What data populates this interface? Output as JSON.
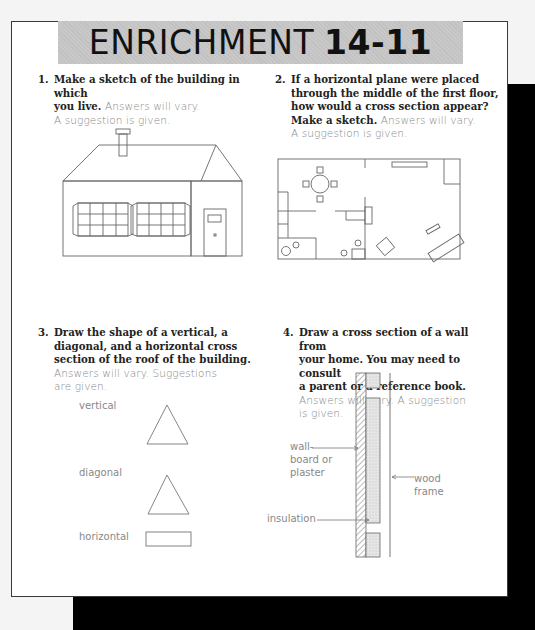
{
  "header": {
    "title_word": "ENRICHMENT",
    "title_number": "14-11"
  },
  "questions": [
    {
      "number": "1.",
      "prompt": "Make a sketch of the building in which you live.",
      "answer": "Answers will vary. A suggestion is given.",
      "figure": "house-sketch"
    },
    {
      "number": "2.",
      "prompt": "If a horizontal plane were placed through the middle of the first floor, how would a cross section appear? Make a sketch.",
      "answer": "Answers will vary. A suggestion is given.",
      "figure": "floor-plan-cross-section"
    },
    {
      "number": "3.",
      "prompt": "Draw the shape of a vertical, a diagonal, and a horizontal cross section of the roof of the building.",
      "answer": "Answers will vary. Suggestions are given.",
      "figure": "roof-cross-sections",
      "labels": [
        "vertical",
        "diagonal",
        "horizontal"
      ]
    },
    {
      "number": "4.",
      "prompt": "Draw a cross section of a wall from your home. You may need to consult a parent or a reference book.",
      "answer": "Answers will vary. A suggestion is given.",
      "figure": "wall-cross-section",
      "labels": [
        "wall-board or plaster",
        "wood frame",
        "insulation"
      ]
    }
  ],
  "q1": {
    "num": "1.",
    "line1": "Make a sketch of the building in which",
    "line2a": "you live.",
    "line2b": "Answers will vary.",
    "line3": "A suggestion is given."
  },
  "q2": {
    "num": "2.",
    "line1": "If a horizontal plane were placed",
    "line2": "through the middle of the first floor,",
    "line3": "how would a cross section appear?",
    "line4a": "Make a sketch.",
    "line4b": "Answers will vary.",
    "line5": "A suggestion is given."
  },
  "q3": {
    "num": "3.",
    "line1": "Draw the shape of a vertical, a",
    "line2": "diagonal, and a horizontal cross",
    "line3": "section of the roof of the building.",
    "line4": "Answers will vary. Suggestions",
    "line5": "are given.",
    "label_vertical": "vertical",
    "label_diagonal": "diagonal",
    "label_horizontal": "horizontal"
  },
  "q4": {
    "num": "4.",
    "line1": "Draw a cross section of a wall from",
    "line2": "your home. You may need to consult",
    "line3": "a parent or a reference book.",
    "line4": "Answers will vary. A suggestion",
    "line5": "is given.",
    "label_wall_1": "wall-",
    "label_wall_2": "board or",
    "label_wall_3": "plaster",
    "label_wood_1": "wood",
    "label_wood_2": "frame",
    "label_insulation": "insulation"
  },
  "colors": {
    "title_band": "#c8c8c8",
    "answer_text": "#888888",
    "shadow": "#000000"
  }
}
